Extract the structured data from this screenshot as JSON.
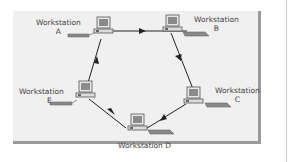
{
  "diagram": {
    "type": "ring-network",
    "nodes": [
      {
        "id": "A",
        "title": "Workstation",
        "letter": "A"
      },
      {
        "id": "B",
        "title": "Workstation",
        "letter": "B"
      },
      {
        "id": "C",
        "title": "Workstation",
        "letter": "C"
      },
      {
        "id": "D",
        "label": "Workstation D"
      },
      {
        "id": "E",
        "title": "Workstation",
        "letter": "E"
      }
    ],
    "edges": [
      {
        "from": "A",
        "to": "B",
        "directed": true
      },
      {
        "from": "B",
        "to": "C",
        "directed": true
      },
      {
        "from": "C",
        "to": "D",
        "directed": true
      },
      {
        "from": "D",
        "to": "E",
        "directed": true
      },
      {
        "from": "E",
        "to": "A",
        "directed": true
      }
    ],
    "colors": {
      "panel": "#f0f0f0",
      "panel_shadow": "#9a9a9a",
      "edge": "#222222",
      "monitor_screen": "#8a8a8a",
      "keyboard": "#7a7a7a"
    }
  }
}
